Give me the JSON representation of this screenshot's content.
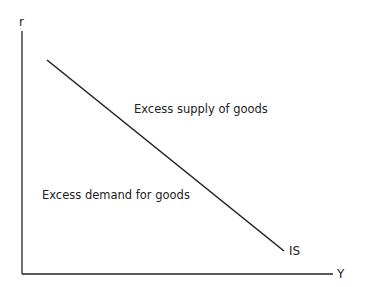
{
  "diagram": {
    "axes": {
      "y_label": "r",
      "x_label": "Y"
    },
    "curve": {
      "label": "IS",
      "x1": 47,
      "y1": 60,
      "x2": 284,
      "y2": 251
    },
    "regions": {
      "above": "Excess supply of goods",
      "below": "Excess demand for goods"
    },
    "colors": {
      "ink": "#222222",
      "background": "#ffffff"
    }
  }
}
